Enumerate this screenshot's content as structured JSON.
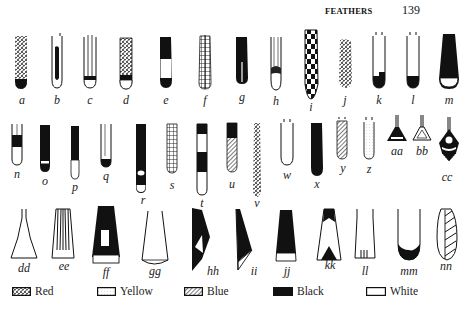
{
  "header": {
    "running_head": "FEATHERS",
    "page_number": "139"
  },
  "figures": {
    "row1": [
      {
        "label": "a",
        "pattern": "red-stipple with black tip"
      },
      {
        "label": "b",
        "pattern": "white outline with black center stripe"
      },
      {
        "label": "c",
        "pattern": "white quill with black band"
      },
      {
        "label": "d",
        "pattern": "red stipple with black band and white tip"
      },
      {
        "label": "e",
        "pattern": "black top, white middle, black tip"
      },
      {
        "label": "f",
        "pattern": "cross-hatched yellow grid"
      },
      {
        "label": "g",
        "pattern": "black with white shaft line"
      },
      {
        "label": "h",
        "pattern": "white with dark band"
      },
      {
        "label": "i",
        "pattern": "black and white checkerboard"
      },
      {
        "label": "j",
        "pattern": "red stipple"
      },
      {
        "label": "k",
        "pattern": "white with black notched tip"
      },
      {
        "label": "l",
        "pattern": "white with black tip"
      },
      {
        "label": "m",
        "pattern": "black with white tip"
      }
    ],
    "row2": [
      {
        "label": "n",
        "pattern": "white with black band"
      },
      {
        "label": "o",
        "pattern": "black with white band"
      },
      {
        "label": "p",
        "pattern": "black with white tip"
      },
      {
        "label": "q",
        "pattern": "white with black tip"
      },
      {
        "label": "r",
        "pattern": "black with white spot and white tip"
      },
      {
        "label": "s",
        "pattern": "grid"
      },
      {
        "label": "t",
        "pattern": "black-white banded"
      },
      {
        "label": "u",
        "pattern": "black top, blue hatched"
      },
      {
        "label": "v",
        "pattern": "red stipple long"
      },
      {
        "label": "w",
        "pattern": "white outline"
      },
      {
        "label": "x",
        "pattern": "solid black"
      },
      {
        "label": "y",
        "pattern": "blue hatched"
      },
      {
        "label": "z",
        "pattern": "yellow dotted outline"
      },
      {
        "label": "aa",
        "pattern": "black triangle"
      },
      {
        "label": "bb",
        "pattern": "white triangle"
      },
      {
        "label": "cc",
        "pattern": "diamond ornament"
      }
    ],
    "row3": [
      {
        "label": "dd",
        "pattern": "white flared"
      },
      {
        "label": "ee",
        "pattern": "striped flared"
      },
      {
        "label": "ff",
        "pattern": "black with white window and white tip"
      },
      {
        "label": "gg",
        "pattern": "white flared rounded"
      },
      {
        "label": "hh",
        "pattern": "black with white triangle"
      },
      {
        "label": "ii",
        "pattern": "black with white corner"
      },
      {
        "label": "jj",
        "pattern": "black with white tip"
      },
      {
        "label": "kk",
        "pattern": "black peaks on white"
      },
      {
        "label": "ll",
        "pattern": "white with tick marks"
      },
      {
        "label": "mm",
        "pattern": "white with black crescent tip"
      },
      {
        "label": "nn",
        "pattern": "diagonal blue stripes"
      }
    ]
  },
  "legend": [
    {
      "label": "Red",
      "swatch": "stipple"
    },
    {
      "label": "Yellow",
      "swatch": "dotted"
    },
    {
      "label": "Blue",
      "swatch": "hatched"
    },
    {
      "label": "Black",
      "swatch": "solid"
    },
    {
      "label": "White",
      "swatch": "empty"
    }
  ],
  "colors": {
    "ink": "#111111",
    "paper": "#ffffff"
  }
}
